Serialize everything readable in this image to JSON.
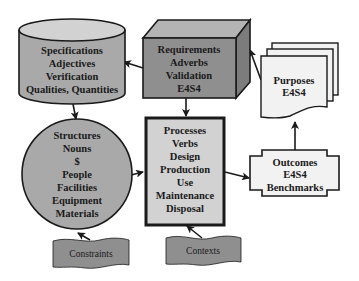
{
  "diagram": {
    "colors": {
      "dark_gray": "#8f8f8f",
      "mid_gray": "#a9a9a9",
      "light_gray": "#d2d2d2",
      "very_light": "#f2f2f2",
      "stroke": "#1a1a1a"
    },
    "nodes": {
      "specifications": {
        "shape": "cylinder",
        "lines": [
          "Specifications",
          "Adjectives",
          "Verification",
          "Qualities, Quantities"
        ]
      },
      "requirements": {
        "shape": "cube",
        "lines": [
          "Requirements",
          "Adverbs",
          "Validation",
          "E4S4"
        ]
      },
      "purposes": {
        "shape": "multi-document",
        "lines": [
          "Purposes",
          "E4S4"
        ]
      },
      "structures": {
        "shape": "circle",
        "lines": [
          "Structures",
          "Nouns",
          "$",
          "People",
          "Facilities",
          "Equipment",
          "Materials"
        ]
      },
      "processes": {
        "shape": "bold-rectangle",
        "lines": [
          "Processes",
          "Verbs",
          "Design",
          "Production",
          "Use",
          "Maintenance",
          "Disposal"
        ]
      },
      "outcomes": {
        "shape": "cross-rectangle",
        "lines": [
          "Outcomes",
          "E4S4",
          "Benchmarks"
        ]
      },
      "constraints": {
        "shape": "tape",
        "lines": [
          "Constraints"
        ]
      },
      "contexts": {
        "shape": "tape",
        "lines": [
          "Contexts"
        ]
      }
    },
    "edges": [
      {
        "from": "requirements",
        "to": "specifications"
      },
      {
        "from": "specifications",
        "to": "structures"
      },
      {
        "from": "requirements",
        "to": "processes"
      },
      {
        "from": "purposes",
        "to": "requirements"
      },
      {
        "from": "structures",
        "to": "processes"
      },
      {
        "from": "processes",
        "to": "outcomes"
      },
      {
        "from": "outcomes",
        "to": "purposes"
      },
      {
        "from": "constraints",
        "to": "structures"
      },
      {
        "from": "contexts",
        "to": "processes"
      }
    ]
  }
}
